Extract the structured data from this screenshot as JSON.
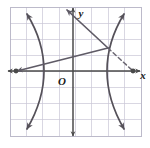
{
  "figure": {
    "name": "hyperbola-with-secant-and-tangent-graph",
    "background_color": "#ffffff",
    "width": 150,
    "height": 148
  },
  "grid": {
    "left": 10,
    "top": 7,
    "right": 141,
    "bottom": 136,
    "cell_size": 16.3,
    "columns": 8,
    "rows": 8,
    "line_color": "#c9c6d6",
    "border_color": "#b5b2c4",
    "visible": true
  },
  "axes": {
    "color": "#4a4a4a",
    "x_axis": {
      "label": "x",
      "label_x": 143,
      "label_y": 79,
      "y_pixel": 71,
      "from_x": 8,
      "to_x": 140,
      "arrow_left": true,
      "arrow_right": true
    },
    "y_axis": {
      "label": "y",
      "label_x": 81,
      "label_y": 17,
      "x_pixel": 73,
      "from_y": 8,
      "to_y": 136,
      "arrow_up": true,
      "arrow_down": true
    },
    "origin": {
      "label": "O",
      "label_x": 62,
      "label_y": 85,
      "x_pixel": 73,
      "y_pixel": 71
    }
  },
  "chart_data": {
    "type": "line",
    "title": "",
    "xlabel": "x",
    "ylabel": "y",
    "grid": true,
    "legend": "none",
    "xlim": [
      -4,
      4
    ],
    "ylim": [
      -4,
      4
    ],
    "curves": [
      {
        "name": "hyperbola-left-branch",
        "style": "solid",
        "color": "#555159",
        "stroke_width": 1.7,
        "arrow_start": true,
        "arrow_end": true,
        "description": "Left branch of a horizontally-opening hyperbola, vertex near x = -1.4 on the x-axis, opening to the left",
        "pixel_path": "M 27 14 C 38 32, 44 52, 44 71 C 44 90, 38 110, 27 129"
      },
      {
        "name": "hyperbola-right-branch",
        "style": "solid",
        "color": "#555159",
        "stroke_width": 1.7,
        "arrow_start": true,
        "arrow_end": true,
        "description": "Right branch of a horizontally-opening hyperbola, vertex near x = 1.4 on the x-axis, opening to the right",
        "pixel_path": "M 124 14 C 113 32, 107 52, 107 71 C 107 90, 113 110, 124 129"
      },
      {
        "name": "secant-line-solid",
        "style": "solid",
        "color": "#5f5b66",
        "stroke_width": 1.7,
        "arrow_start": true,
        "arrow_end": false,
        "description": "Solid line from the left point on the x-axis rising to the right and passing through the point on the right branch of the hyperbola",
        "pixel_path": "M 16 71 L 108 48"
      },
      {
        "name": "steep-line-solid",
        "style": "solid",
        "color": "#5f5b66",
        "stroke_width": 1.7,
        "arrow_start": false,
        "arrow_end": true,
        "description": "Solid line rising steeply up and to the left from the point on the right branch, exiting past the y-axis at the top",
        "pixel_path": "M 108 48 L 66 9"
      },
      {
        "name": "tangent-line-dashed",
        "style": "dashed",
        "color": "#6b6772",
        "stroke_width": 1.5,
        "dash_pattern": "4,3",
        "arrow_start": false,
        "arrow_end": false,
        "description": "Dashed segment from the point on the right branch down to the marked point on the x-axis at the right",
        "pixel_path": "M 108 48 L 133 71"
      }
    ],
    "points": [
      {
        "name": "left-x-axis-point",
        "pixel_x": 16,
        "pixel_y": 71,
        "radius": 2.4,
        "color": "#4a4a4a",
        "filled": true,
        "label": ""
      },
      {
        "name": "right-x-axis-point",
        "pixel_x": 133,
        "pixel_y": 71,
        "radius": 2.4,
        "color": "#4a4a4a",
        "filled": true,
        "label": ""
      }
    ]
  }
}
